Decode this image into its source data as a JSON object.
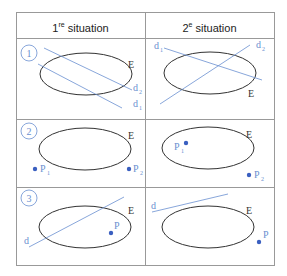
{
  "header": {
    "col1_num": "1",
    "col1_sup": "re",
    "col1_text": " situation",
    "col2_num": "2",
    "col2_sup": "e",
    "col2_text": " situation"
  },
  "rows": [
    {
      "number": "1",
      "left": {
        "ellipse_label": "E",
        "lines": [
          "d2",
          "d1"
        ]
      },
      "right": {
        "ellipse_label": "E",
        "lines": [
          "d1",
          "d2"
        ]
      }
    },
    {
      "number": "2",
      "left": {
        "ellipse_label": "E",
        "points": [
          "P1",
          "P2"
        ]
      },
      "right": {
        "ellipse_label": "E",
        "points": [
          "P1",
          "P2"
        ]
      }
    },
    {
      "number": "3",
      "left": {
        "ellipse_label": "E",
        "line": "d",
        "point": "P"
      },
      "right": {
        "ellipse_label": "E",
        "line": "d",
        "point": "P"
      }
    }
  ],
  "labels": {
    "E": "E",
    "d": "d",
    "d1": "d",
    "d2": "d",
    "sub1": "1",
    "sub2": "2",
    "P": "P",
    "n1": "1",
    "n2": "2",
    "n3": "3"
  },
  "colors": {
    "blue": "#6a8fd0",
    "dot": "#3a5fc0",
    "ellipse": "#333333",
    "grid": "#999999"
  }
}
